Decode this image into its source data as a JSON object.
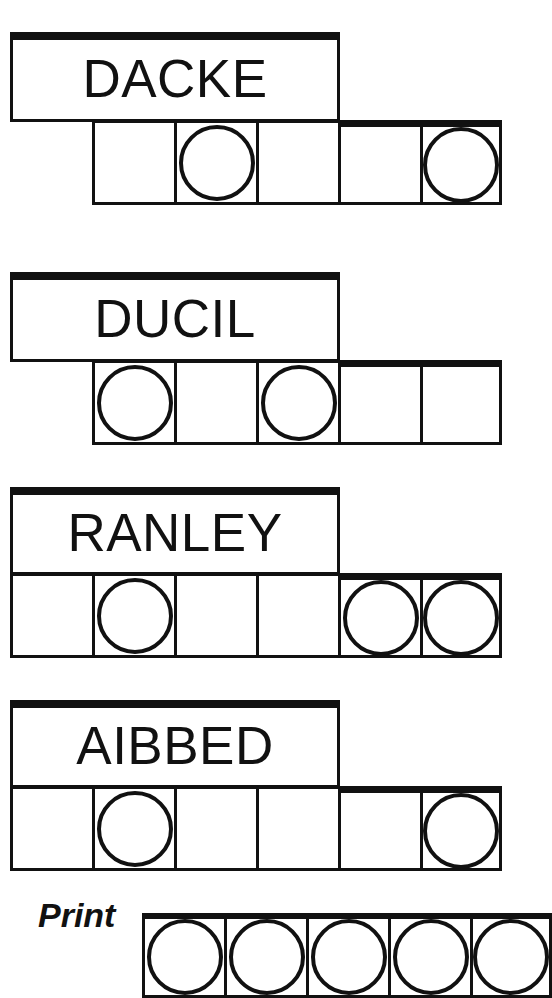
{
  "page": {
    "background_color": "#ffffff",
    "ink_color": "#111111",
    "width": 523,
    "height": 955
  },
  "groups": [
    {
      "word": "DACKE",
      "word_box": {
        "left": 10,
        "top": 32,
        "width": 330,
        "height": 90
      },
      "cell_row": {
        "left": 92,
        "top": 120,
        "cell_width": 82,
        "cell_height": 85
      },
      "cells": [
        {
          "circle": false
        },
        {
          "circle": true
        },
        {
          "circle": false
        },
        {
          "circle": false
        },
        {
          "circle": true
        }
      ]
    },
    {
      "word": "DUCIL",
      "word_box": {
        "left": 10,
        "top": 272,
        "width": 330,
        "height": 90
      },
      "cell_row": {
        "left": 92,
        "top": 360,
        "cell_width": 82,
        "cell_height": 85
      },
      "cells": [
        {
          "circle": true
        },
        {
          "circle": false
        },
        {
          "circle": true
        },
        {
          "circle": false
        },
        {
          "circle": false
        }
      ]
    },
    {
      "word": "RANLEY",
      "word_box": {
        "left": 10,
        "top": 487,
        "width": 330,
        "height": 88
      },
      "cell_row": {
        "left": 10,
        "top": 573,
        "cell_width": 82,
        "cell_height": 85
      },
      "cells": [
        {
          "circle": false
        },
        {
          "circle": true
        },
        {
          "circle": false
        },
        {
          "circle": false
        },
        {
          "circle": true
        },
        {
          "circle": true
        }
      ]
    },
    {
      "word": "AIBBED",
      "word_box": {
        "left": 10,
        "top": 700,
        "width": 330,
        "height": 88
      },
      "cell_row": {
        "left": 10,
        "top": 786,
        "cell_width": 82,
        "cell_height": 85
      },
      "cells": [
        {
          "circle": false
        },
        {
          "circle": true
        },
        {
          "circle": false
        },
        {
          "circle": false
        },
        {
          "circle": false
        },
        {
          "circle": true
        }
      ]
    }
  ],
  "print_row": {
    "label": "Print",
    "label_position": {
      "left": 38,
      "top": 898
    },
    "cell_row": {
      "left": 142,
      "top": 913,
      "cell_width": 82,
      "cell_height": 85
    },
    "cells": [
      {
        "circle": true
      },
      {
        "circle": true
      },
      {
        "circle": true
      },
      {
        "circle": true
      },
      {
        "circle": true
      }
    ]
  }
}
